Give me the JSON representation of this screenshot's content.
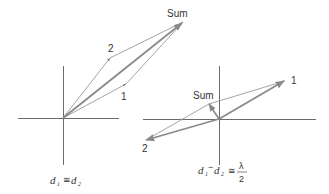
{
  "colors": {
    "axis": "#6a6a6a",
    "component": "#9a9a9a",
    "sum": "#8a8a8a",
    "text": "#333333"
  },
  "left_diagram": {
    "vector_labels": {
      "one": "1",
      "two": "2",
      "sum": "Sum"
    },
    "caption": {
      "d": "d",
      "sub1": "1",
      "relation": "≅",
      "sub2": "2"
    }
  },
  "right_diagram": {
    "vector_labels": {
      "one": "1",
      "two": "2",
      "sum": "Sum"
    },
    "caption": {
      "d": "d",
      "sub1": "1",
      "minus": "−",
      "sub2": "2",
      "relation": "≅",
      "numerator": "λ",
      "denominator": "2"
    }
  }
}
